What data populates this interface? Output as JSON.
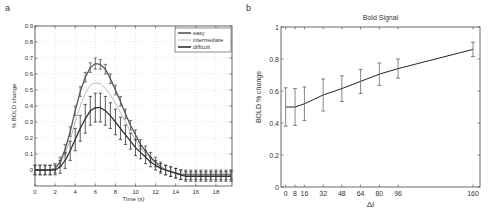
{
  "panels": {
    "a": {
      "label": "a"
    },
    "b": {
      "label": "b"
    }
  },
  "chart_data": [
    {
      "type": "line",
      "panel": "a",
      "title": "",
      "xlabel": "Time (s)",
      "ylabel": "% BOLD change",
      "xlim": [
        0,
        19.6
      ],
      "ylim": [
        -0.1,
        0.9
      ],
      "xticks": [
        0,
        2,
        4,
        6,
        8,
        10,
        12,
        14,
        16,
        18
      ],
      "yticks": [
        0,
        0.1,
        0.2,
        0.3,
        0.4,
        0.5,
        0.6,
        0.7,
        0.8,
        0.9
      ],
      "grid": true,
      "legend": {
        "position": "upper right",
        "entries": [
          "easy",
          "intermediate",
          "difficult"
        ]
      },
      "x": [
        0,
        0.5,
        1,
        1.5,
        2,
        2.5,
        3,
        3.5,
        4,
        4.5,
        5,
        5.5,
        6,
        6.5,
        7,
        7.5,
        8,
        8.5,
        9,
        9.5,
        10,
        10.5,
        11,
        11.5,
        12,
        12.5,
        13,
        13.5,
        14,
        14.5,
        15,
        15.5,
        16,
        16.5,
        17,
        17.5,
        18,
        18.5,
        19,
        19.5
      ],
      "series": [
        {
          "name": "easy",
          "color": "#555555",
          "values": [
            0,
            0,
            0,
            0,
            0.01,
            0.05,
            0.13,
            0.24,
            0.37,
            0.49,
            0.58,
            0.64,
            0.665,
            0.66,
            0.63,
            0.57,
            0.5,
            0.43,
            0.35,
            0.28,
            0.22,
            0.16,
            0.12,
            0.08,
            0.05,
            0.02,
            0,
            -0.01,
            -0.02,
            -0.03,
            -0.03,
            -0.03,
            -0.03,
            -0.03,
            -0.03,
            -0.03,
            -0.03,
            -0.03,
            -0.03,
            -0.03
          ],
          "error": [
            0.03,
            0.03,
            0.03,
            0.03,
            0.03,
            0.03,
            0.03,
            0.03,
            0.03,
            0.03,
            0.03,
            0.03,
            0.035,
            0.03,
            0.03,
            0.03,
            0.03,
            0.03,
            0.03,
            0.03,
            0.03,
            0.03,
            0.03,
            0.03,
            0.03,
            0.03,
            0.03,
            0.03,
            0.03,
            0.03,
            0.03,
            0.03,
            0.03,
            0.03,
            0.03,
            0.03,
            0.03,
            0.03,
            0.03,
            0.03
          ]
        },
        {
          "name": "intermediate",
          "color": "#aaaaaa",
          "values": [
            0,
            0,
            0,
            0,
            0.01,
            0.04,
            0.1,
            0.19,
            0.3,
            0.4,
            0.48,
            0.53,
            0.545,
            0.54,
            0.51,
            0.47,
            0.42,
            0.36,
            0.3,
            0.24,
            0.19,
            0.14,
            0.1,
            0.07,
            0.04,
            0.02,
            0,
            -0.01,
            -0.02,
            -0.02,
            -0.02,
            -0.02,
            -0.02,
            -0.02,
            -0.02,
            -0.02,
            -0.02,
            -0.02,
            -0.02,
            -0.02
          ],
          "error": []
        },
        {
          "name": "difficult",
          "color": "#333333",
          "values": [
            0,
            0,
            0,
            0,
            0,
            0.02,
            0.06,
            0.12,
            0.19,
            0.26,
            0.32,
            0.37,
            0.39,
            0.39,
            0.37,
            0.34,
            0.3,
            0.26,
            0.22,
            0.18,
            0.14,
            0.11,
            0.08,
            0.05,
            0.03,
            0.01,
            0,
            -0.01,
            -0.02,
            -0.03,
            -0.04,
            -0.04,
            -0.04,
            -0.04,
            -0.04,
            -0.04,
            -0.04,
            -0.04,
            -0.04,
            -0.04
          ],
          "error": [
            0.03,
            0.03,
            0.03,
            0.03,
            0.03,
            0.04,
            0.05,
            0.06,
            0.07,
            0.08,
            0.09,
            0.09,
            0.09,
            0.09,
            0.09,
            0.08,
            0.08,
            0.07,
            0.06,
            0.05,
            0.05,
            0.04,
            0.04,
            0.03,
            0.03,
            0.03,
            0.03,
            0.03,
            0.03,
            0.03,
            0.03,
            0.03,
            0.03,
            0.03,
            0.03,
            0.03,
            0.03,
            0.03,
            0.03,
            0.03
          ]
        }
      ]
    },
    {
      "type": "line",
      "panel": "b",
      "title": "Bold Signal",
      "xlabel": "ΔI",
      "ylabel": "BOLD % change",
      "xlim": [
        -4,
        166
      ],
      "ylim": [
        0,
        1
      ],
      "xticks": [
        0,
        8,
        16,
        32,
        48,
        64,
        80,
        96,
        160
      ],
      "yticks": [
        0,
        0.2,
        0.4,
        0.6,
        0.8,
        1
      ],
      "ytick_labels": [
        "0",
        "0.2",
        "0.4",
        "0.6",
        "0.8",
        "1"
      ],
      "grid": false,
      "series": [
        {
          "name": "BOLD",
          "color": "#222222",
          "x": [
            0,
            8,
            16,
            32,
            48,
            64,
            80,
            96,
            160
          ],
          "values": [
            0.5,
            0.5,
            0.52,
            0.575,
            0.615,
            0.66,
            0.705,
            0.74,
            0.86
          ],
          "error": [
            0.12,
            0.115,
            0.105,
            0.1,
            0.08,
            0.075,
            0.07,
            0.06,
            0.045
          ]
        }
      ]
    }
  ]
}
